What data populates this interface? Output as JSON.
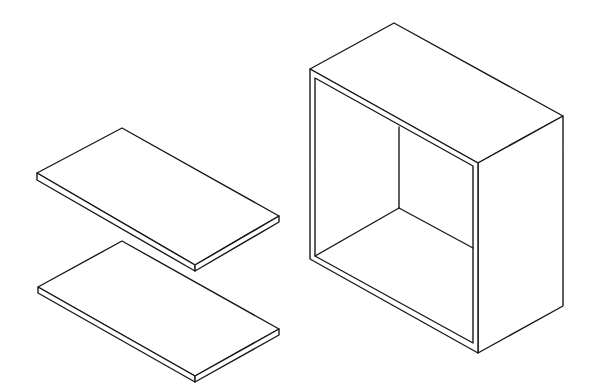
{
  "figure": {
    "colors": {
      "line": "#1a1a1a",
      "background": "#ffffff"
    },
    "parts": [
      {
        "name": "top-panel",
        "type": "flat panel"
      },
      {
        "name": "bottom-panel",
        "type": "flat panel"
      },
      {
        "name": "open-box",
        "type": "box carcass, open front"
      }
    ]
  }
}
